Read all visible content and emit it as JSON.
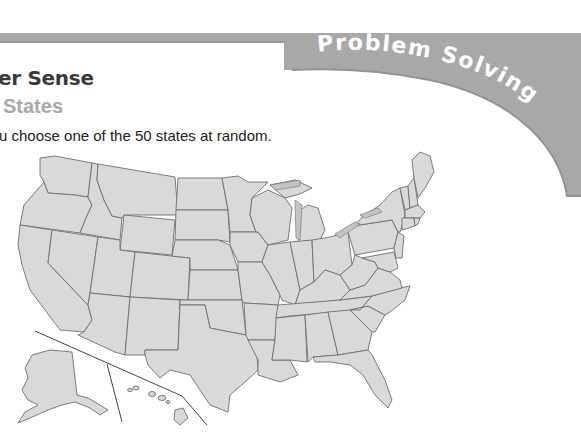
{
  "header": {
    "section_title": "er Sense",
    "lesson_title": "States",
    "banner_label": "Problem Solving",
    "banner_color": "#a8a8a8"
  },
  "problem": {
    "prompt": "u choose one of the 50 states at random."
  },
  "map": {
    "subject": "United States map",
    "state_count": 50,
    "fill_color": "#d9d9d9",
    "border_color": "#6e6e6e",
    "insets": [
      "Alaska",
      "Hawaii"
    ]
  }
}
